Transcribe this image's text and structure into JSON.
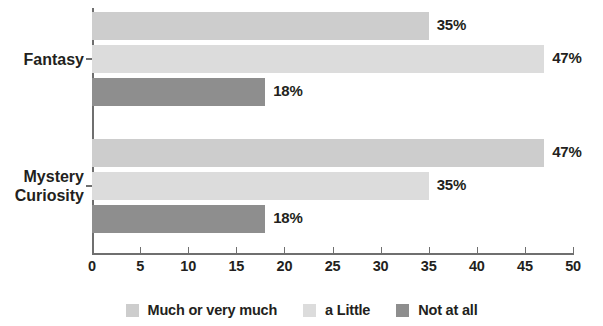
{
  "chart_data": {
    "type": "bar",
    "orientation": "horizontal",
    "grouped": true,
    "title": "",
    "xlabel": "",
    "ylabel": "",
    "xlim": [
      0,
      50
    ],
    "xticks": [
      0,
      5,
      10,
      15,
      20,
      25,
      30,
      35,
      40,
      45,
      50
    ],
    "xtick_labels": [
      "0",
      "5",
      "10",
      "15",
      "20",
      "25",
      "30",
      "35",
      "40",
      "45",
      "50"
    ],
    "grid": false,
    "legend_position": "bottom",
    "categories": [
      "Fantasy",
      "Mystery\nCuriosity"
    ],
    "series": [
      {
        "name": "Much or very much",
        "color": "#cdcdcd",
        "values": [
          35,
          47
        ],
        "labels": [
          "35%",
          "47%"
        ]
      },
      {
        "name": "a Little",
        "color": "#dcdcdc",
        "values": [
          47,
          35
        ],
        "labels": [
          "47%",
          "35%"
        ]
      },
      {
        "name": "Not at all",
        "color": "#8e8e8e",
        "values": [
          18,
          18
        ],
        "labels": [
          "18%",
          "18%"
        ]
      }
    ],
    "legend": [
      {
        "label": "Much or very much",
        "color": "#cdcdcd"
      },
      {
        "label": "a Little",
        "color": "#dcdcdc"
      },
      {
        "label": "Not at all",
        "color": "#8e8e8e"
      }
    ],
    "axis_color": "#6f6f6f",
    "text_color": "#231f20"
  }
}
